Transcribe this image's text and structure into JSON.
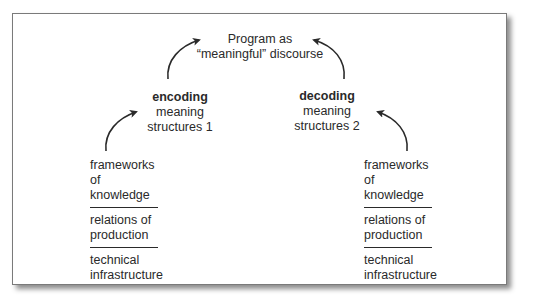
{
  "diagram": {
    "top": {
      "line1": "Program as",
      "line2": "“meaningful” discourse"
    },
    "encoding": {
      "title": "encoding",
      "line1": "meaning",
      "line2": "structures 1"
    },
    "decoding": {
      "title": "decoding",
      "line1": "meaning",
      "line2": "structures 2"
    },
    "left_stack": {
      "items": [
        {
          "line1": "frameworks",
          "line2": "of knowledge"
        },
        {
          "line1": "relations of",
          "line2": "production"
        },
        {
          "line1": "technical",
          "line2": "infrastructure"
        }
      ]
    },
    "right_stack": {
      "items": [
        {
          "line1": "frameworks",
          "line2": "of knowledge"
        },
        {
          "line1": "relations of",
          "line2": "production"
        },
        {
          "line1": "technical",
          "line2": "infrastructure"
        }
      ]
    },
    "arrows": [
      {
        "from": "left_stack",
        "to": "encoding"
      },
      {
        "from": "encoding",
        "to": "top"
      },
      {
        "from": "decoding",
        "to": "top"
      },
      {
        "from": "right_stack",
        "to": "decoding"
      }
    ],
    "colors": {
      "ink": "#2a2a2a",
      "border": "#7a7a7a",
      "background": "#ffffff"
    }
  }
}
